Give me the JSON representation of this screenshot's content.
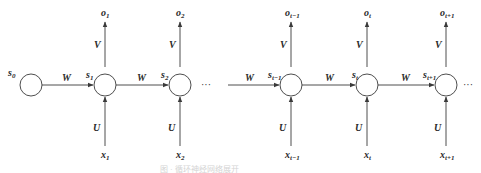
{
  "diagram": {
    "type": "unrolled-rnn",
    "colors": {
      "stroke": "#3a3a3a",
      "text": "#2a2a2a",
      "background": "#ffffff"
    },
    "ellipsis": "···",
    "nodes": [
      {
        "id": "s0",
        "state": "s",
        "sub": "0",
        "cx": 31
      },
      {
        "id": "s1",
        "state": "s",
        "sub": "1",
        "cx": 105,
        "input": "x",
        "input_sub": "1",
        "output": "o",
        "output_sub": "1"
      },
      {
        "id": "s2",
        "state": "s",
        "sub": "2",
        "cx": 180,
        "input": "x",
        "input_sub": "2",
        "output": "o",
        "output_sub": "2"
      },
      {
        "id": "s_t-1",
        "state": "s",
        "sub": "t−1",
        "cx": 291,
        "input": "x",
        "input_sub": "t−1",
        "output": "o",
        "output_sub": "t−1"
      },
      {
        "id": "s_t",
        "state": "s",
        "sub": "t",
        "cx": 367,
        "input": "x",
        "input_sub": "t",
        "output": "o",
        "output_sub": "t"
      },
      {
        "id": "s_t+1",
        "state": "s",
        "sub": "t+1",
        "cx": 446,
        "input": "x",
        "input_sub": "t+1",
        "output": "o",
        "output_sub": "t+1"
      }
    ],
    "weights": {
      "recurrent": "W",
      "input": "U",
      "output": "V"
    },
    "caption": "图 · 循环神经网络展开"
  }
}
